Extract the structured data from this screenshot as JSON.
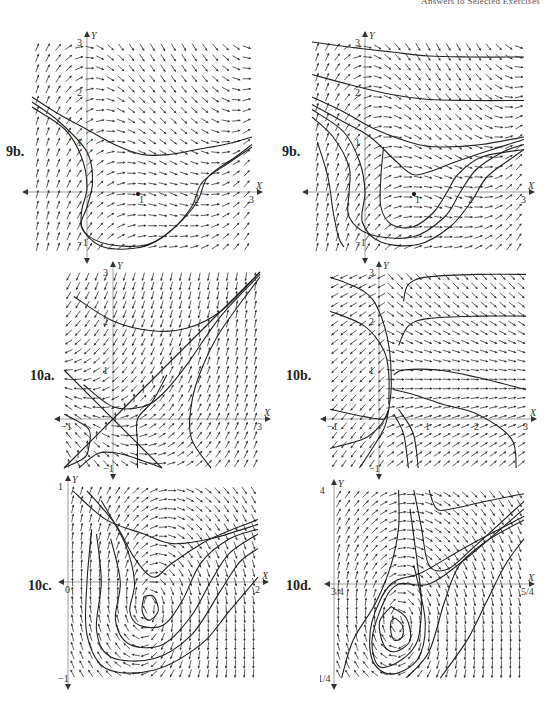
{
  "header": {
    "running_head": "Answers to Selected Exercises"
  },
  "chart_data": [
    {
      "id": "9b-left",
      "label": "9b.",
      "type": "direction-field",
      "xlabel": "X",
      "ylabel": "Y",
      "xlim": [
        -1,
        3
      ],
      "ylim": [
        -1.2,
        3
      ],
      "x_ticks": [
        "1",
        "2",
        "3"
      ],
      "y_ticks": [
        "-1",
        "1",
        "2",
        "3"
      ],
      "equilibrium_points": [
        [
          1,
          0
        ]
      ],
      "solution_curves": 2,
      "box": {
        "left": 32,
        "top": 42,
        "width": 220,
        "height": 210
      },
      "label_pos": {
        "left": 6,
        "top": 144
      }
    },
    {
      "id": "9b-right",
      "label": "9b.",
      "type": "direction-field",
      "xlabel": "X",
      "ylabel": "Y",
      "xlim": [
        -1,
        3
      ],
      "ylim": [
        -1.2,
        3
      ],
      "x_ticks": [
        "1",
        "2",
        "3"
      ],
      "y_ticks": [
        "-1",
        "1",
        "2",
        "3"
      ],
      "equilibrium_points": [
        [
          1,
          0
        ]
      ],
      "solution_curves": 7,
      "box": {
        "left": 312,
        "top": 42,
        "width": 212,
        "height": 210
      },
      "label_pos": {
        "left": 282,
        "top": 144
      }
    },
    {
      "id": "10a",
      "label": "10a.",
      "type": "direction-field",
      "xlabel": "X",
      "ylabel": "Y",
      "xlim": [
        -1,
        3
      ],
      "ylim": [
        -1,
        3
      ],
      "x_ticks": [
        "-1",
        "3"
      ],
      "y_ticks": [
        "-1",
        "1",
        "2",
        "3"
      ],
      "equilibrium_points": [
        [
          0,
          0
        ]
      ],
      "solution_curves": 6,
      "box": {
        "left": 64,
        "top": 272,
        "width": 196,
        "height": 196
      },
      "label_pos": {
        "left": 30,
        "top": 368
      }
    },
    {
      "id": "10b",
      "label": "10b.",
      "type": "direction-field",
      "xlabel": "X",
      "ylabel": "Y",
      "xlim": [
        -1,
        3
      ],
      "ylim": [
        -1,
        3
      ],
      "x_ticks": [
        "-1",
        "1",
        "2",
        "3"
      ],
      "y_ticks": [
        "-1",
        "1",
        "2",
        "3"
      ],
      "equilibrium_points": [
        [
          0.2,
          0.2
        ]
      ],
      "solution_curves": 8,
      "box": {
        "left": 330,
        "top": 272,
        "width": 196,
        "height": 196
      },
      "label_pos": {
        "left": 286,
        "top": 368
      }
    },
    {
      "id": "10c",
      "label": "10c.",
      "type": "direction-field",
      "xlabel": "X",
      "ylabel": "Y",
      "xlim": [
        0,
        2
      ],
      "ylim": [
        -1,
        1
      ],
      "x_ticks": [
        "0",
        "2"
      ],
      "y_ticks": [
        "-1",
        "1"
      ],
      "equilibrium_points": [
        [
          0.85,
          -0.25
        ]
      ],
      "solution_curves": 6,
      "box": {
        "left": 68,
        "top": 486,
        "width": 190,
        "height": 192
      },
      "label_pos": {
        "left": 28,
        "top": 578
      }
    },
    {
      "id": "10d",
      "label": "10d.",
      "type": "direction-field",
      "xlabel": "X",
      "ylabel": "Y",
      "xlim": [
        0.75,
        1.25
      ],
      "ylim": [
        -0.25,
        0.25
      ],
      "x_ticks": [
        "3/4",
        "5/4"
      ],
      "y_ticks": [
        "-1/4",
        "1/4"
      ],
      "equilibrium_points": [
        [
          0.92,
          -0.1
        ]
      ],
      "solution_curves": 8,
      "box": {
        "left": 334,
        "top": 490,
        "width": 190,
        "height": 188
      },
      "label_pos": {
        "left": 286,
        "top": 578
      }
    }
  ]
}
